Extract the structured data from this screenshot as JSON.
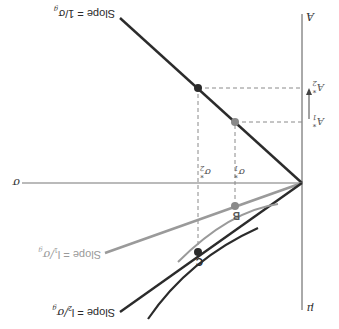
{
  "diagram": {
    "orientation": "rotated-180",
    "colors": {
      "dark": "#2b2b2b",
      "gray": "#9a9a9a",
      "axis": "#555555",
      "dashed": "#8a8a8a"
    },
    "axes": {
      "vertical_top_label": "A",
      "vertical_bottom_label": "μ",
      "horizontal_label": "σ"
    },
    "lines": {
      "slope_1_label": "Slope = 1/σ",
      "slope_1_sub": "g",
      "slope_l1_label": "Slope = l",
      "slope_l1_sub": "1",
      "slope_l1_tail": "/σ",
      "slope_l1_tail_sub": "g",
      "slope_l2_label": "Slope = l",
      "slope_l2_sub": "2",
      "slope_l2_tail": "/σ",
      "slope_l2_tail_sub": "g"
    },
    "points": {
      "B": "B",
      "C": "C"
    },
    "ticks": {
      "A1": "A",
      "A1_sub": "1",
      "A1_sup": "*",
      "A2": "A",
      "A2_sub": "2",
      "A2_sup": "*",
      "sigma1": "σ",
      "sigma1_sub": "1",
      "sigma1_sup": "*",
      "sigma2": "σ",
      "sigma2_sub": "2",
      "sigma2_sup": "*"
    }
  }
}
